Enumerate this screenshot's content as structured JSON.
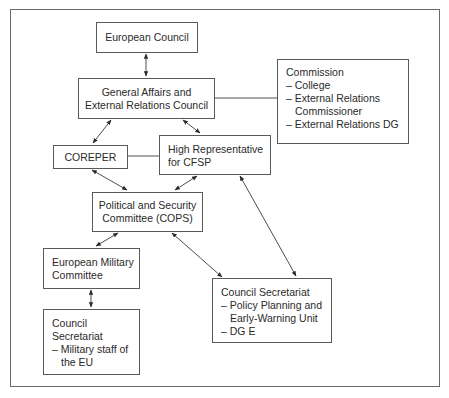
{
  "diagram": {
    "type": "organization-flow",
    "nodes": {
      "european_council": {
        "lines": [
          "European Council"
        ]
      },
      "gaerc": {
        "lines": [
          "General Affairs and",
          "External Relations Council"
        ]
      },
      "commission": {
        "title": "Commission",
        "items": [
          {
            "first": "– College"
          },
          {
            "first": "– External Relations",
            "cont": "Commissioner"
          },
          {
            "first": "– External Relations DG"
          }
        ]
      },
      "coreper": {
        "lines": [
          "COREPER"
        ]
      },
      "high_rep": {
        "lines": [
          "High Representative",
          "for CFSP"
        ]
      },
      "cops": {
        "lines": [
          "Political and Security",
          "Committee (COPS)"
        ]
      },
      "emc": {
        "lines": [
          "European Military",
          "Committee"
        ]
      },
      "council_sec_military": {
        "title1": "Council",
        "title2": "Secretariat",
        "items": [
          {
            "first": "– Military staff of",
            "cont": "the EU"
          }
        ]
      },
      "council_sec_ppewu": {
        "title": "Council Secretariat",
        "items": [
          {
            "first": "– Policy Planning and",
            "cont": "Early-Warning Unit"
          },
          {
            "first": "– DG E"
          }
        ]
      }
    },
    "edges": [
      {
        "from": "european_council",
        "to": "gaerc",
        "arrows": "both"
      },
      {
        "from": "gaerc",
        "to": "commission",
        "arrows": "none"
      },
      {
        "from": "gaerc",
        "to": "coreper",
        "arrows": "both"
      },
      {
        "from": "gaerc",
        "to": "high_rep",
        "arrows": "both"
      },
      {
        "from": "coreper",
        "to": "high_rep",
        "arrows": "none"
      },
      {
        "from": "coreper",
        "to": "cops",
        "arrows": "both"
      },
      {
        "from": "high_rep",
        "to": "cops",
        "arrows": "both"
      },
      {
        "from": "high_rep",
        "to": "council_sec_ppewu",
        "arrows": "both"
      },
      {
        "from": "cops",
        "to": "emc",
        "arrows": "both"
      },
      {
        "from": "cops",
        "to": "council_sec_ppewu",
        "arrows": "both"
      },
      {
        "from": "emc",
        "to": "council_sec_military",
        "arrows": "both"
      }
    ],
    "colors": {
      "line": "#3a3a3a",
      "border": "#5a5a5a",
      "text": "#2a2a2a",
      "background": "#ffffff"
    }
  }
}
